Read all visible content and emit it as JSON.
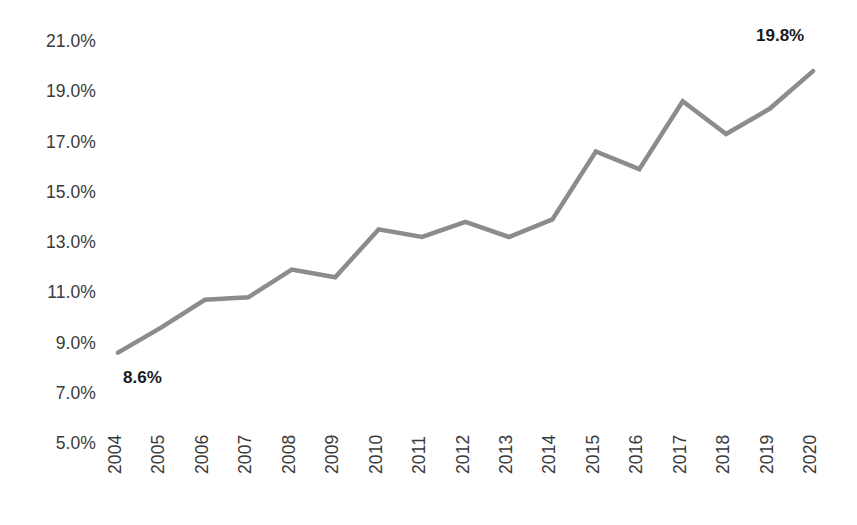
{
  "chart_data": {
    "type": "line",
    "title": "",
    "subtitle": "",
    "xlabel": "",
    "ylabel": "",
    "categories": [
      "2004",
      "2005",
      "2006",
      "2007",
      "2008",
      "2009",
      "2010",
      "2011",
      "2012",
      "2013",
      "2014",
      "2015",
      "2016",
      "2017",
      "2018",
      "2019",
      "2020"
    ],
    "values": [
      8.6,
      9.6,
      10.7,
      10.8,
      11.9,
      11.6,
      13.5,
      13.2,
      13.8,
      13.2,
      13.9,
      16.6,
      15.9,
      18.6,
      17.3,
      18.3,
      19.8
    ],
    "series": [
      {
        "name": "",
        "values": [
          8.6,
          9.6,
          10.7,
          10.8,
          11.9,
          11.6,
          13.5,
          13.2,
          13.8,
          13.2,
          13.9,
          16.6,
          15.9,
          18.6,
          17.3,
          18.3,
          19.8
        ]
      }
    ],
    "ylim": [
      5.0,
      21.0
    ],
    "ytick_values": [
      5.0,
      7.0,
      9.0,
      11.0,
      13.0,
      15.0,
      17.0,
      19.0,
      21.0
    ],
    "ytick_labels": [
      "5.0%",
      "7.0%",
      "9.0%",
      "11.0%",
      "13.0%",
      "15.0%",
      "17.0%",
      "19.0%",
      "21.0%"
    ],
    "ytick_step": 2.0,
    "grid": false,
    "legend": "none",
    "annotations": [
      {
        "name": "first-point-label",
        "text": "8.6%",
        "category": "2004",
        "value": 8.6
      },
      {
        "name": "last-point-label",
        "text": "19.8%",
        "category": "2020",
        "value": 19.8
      }
    ],
    "colors": {
      "line": "#8c8c8c",
      "text": "#3a3a3a",
      "label_text": "#1a1a1a",
      "background": "#ffffff"
    },
    "line_width": 4.5
  }
}
